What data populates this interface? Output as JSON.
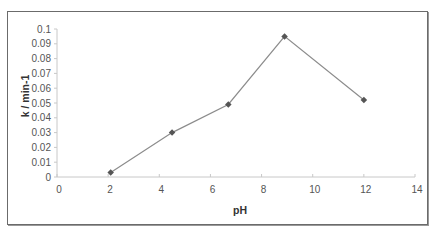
{
  "chart_data": {
    "type": "line",
    "title": "",
    "xlabel": "pH",
    "ylabel": "k / min-1",
    "xlim": [
      0,
      14
    ],
    "ylim": [
      0,
      0.1
    ],
    "x_ticks": [
      0,
      2,
      4,
      6,
      8,
      10,
      12,
      14
    ],
    "y_ticks": [
      0,
      0.01,
      0.02,
      0.03,
      0.04,
      0.05,
      0.06,
      0.07,
      0.08,
      0.09,
      0.1
    ],
    "x_tick_labels": [
      "0",
      "2",
      "4",
      "6",
      "8",
      "10",
      "12",
      "14"
    ],
    "y_tick_labels": [
      "0",
      "0.01",
      "0.02",
      "0.03",
      "0.04",
      "0.05",
      "0.06",
      "0.07",
      "0.08",
      "0.09",
      "0.1"
    ],
    "grid": false,
    "legend": null,
    "series": [
      {
        "name": "k",
        "color": "#8c8c8c",
        "marker_color": "#555555",
        "x": [
          2.1,
          4.5,
          6.7,
          8.9,
          12.0
        ],
        "y": [
          0.003,
          0.03,
          0.049,
          0.095,
          0.052
        ]
      }
    ]
  }
}
